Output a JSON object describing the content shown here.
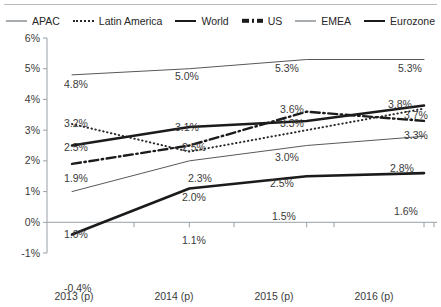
{
  "legend": {
    "items": [
      {
        "label": "APAC",
        "style": "thin"
      },
      {
        "label": "Latin America",
        "style": "dotted"
      },
      {
        "label": "World",
        "style": "thick"
      },
      {
        "label": "US",
        "style": "dashdot"
      },
      {
        "label": "EMEA",
        "style": "thin"
      },
      {
        "label": "Eurozone",
        "style": "thick"
      }
    ]
  },
  "chart_data": {
    "type": "line",
    "title": "",
    "xlabel": "",
    "ylabel": "",
    "categories": [
      "2013 (p)",
      "2014 (p)",
      "2015 (p)",
      "2016 (p)"
    ],
    "ylim": [
      -1,
      6
    ],
    "yticks": [
      "-1%",
      "0%",
      "1%",
      "2%",
      "3%",
      "4%",
      "5%",
      "6%"
    ],
    "ytick_values": [
      -1,
      0,
      1,
      2,
      3,
      4,
      5,
      6
    ],
    "grid": false,
    "legend_position": "top",
    "zero_line": true,
    "series": [
      {
        "name": "APAC",
        "style": "thin",
        "values": [
          4.8,
          5.0,
          5.3,
          5.3
        ],
        "labels": [
          "4.8%",
          "5.0%",
          "5.3%",
          "5.3%"
        ]
      },
      {
        "name": "Latin America",
        "style": "dotted",
        "values": [
          3.2,
          2.3,
          3.0,
          3.7
        ],
        "labels": [
          "3.2%",
          "2.3%",
          "3.0%",
          "3.7%"
        ]
      },
      {
        "name": "World",
        "style": "thick",
        "values": [
          2.5,
          3.1,
          3.3,
          3.8
        ],
        "labels": [
          "2.5%",
          "3.1%",
          "3.3%",
          "3.8%"
        ]
      },
      {
        "name": "US",
        "style": "dashdot",
        "values": [
          1.9,
          2.5,
          3.6,
          3.3
        ],
        "labels": [
          "1.9%",
          "2.5%",
          "3.6%",
          "3.3%"
        ]
      },
      {
        "name": "EMEA",
        "style": "thin",
        "values": [
          1.0,
          2.0,
          2.5,
          2.8
        ],
        "labels": [
          "1.0%",
          "2.0%",
          "2.5%",
          "2.8%"
        ]
      },
      {
        "name": "Eurozone",
        "style": "thick",
        "values": [
          -0.4,
          1.1,
          1.5,
          1.6
        ],
        "labels": [
          "-0.4%",
          "1.1%",
          "1.5%",
          "1.6%"
        ]
      }
    ],
    "colors": {
      "thin": "#55595e",
      "thick": "#1b1b1b",
      "dotted": "#2a2a2a",
      "dashdot": "#1b1b1b",
      "axis": "#9aa0a6",
      "text": "#3a3a3a"
    }
  },
  "data_labels": [
    {
      "text": "4.8%",
      "x": 64,
      "y": 79
    },
    {
      "text": "5.0%",
      "x": 175,
      "y": 71
    },
    {
      "text": "5.3%",
      "x": 275,
      "y": 63
    },
    {
      "text": "5.3%",
      "x": 398,
      "y": 63
    },
    {
      "text": "3.2%",
      "x": 64,
      "y": 118
    },
    {
      "text": "2.3%",
      "x": 188,
      "y": 173
    },
    {
      "text": "3.0%",
      "x": 275,
      "y": 152
    },
    {
      "text": "3.7%",
      "x": 404,
      "y": 110
    },
    {
      "text": "2.5%",
      "x": 64,
      "y": 142
    },
    {
      "text": "3.1%",
      "x": 175,
      "y": 122
    },
    {
      "text": "3.3%",
      "x": 280,
      "y": 118
    },
    {
      "text": "3.8%",
      "x": 388,
      "y": 99
    },
    {
      "text": "1.9%",
      "x": 64,
      "y": 173
    },
    {
      "text": "2.5%",
      "x": 182,
      "y": 142
    },
    {
      "text": "3.6%",
      "x": 280,
      "y": 104
    },
    {
      "text": "3.3%",
      "x": 404,
      "y": 130
    },
    {
      "text": "1.0%",
      "x": 64,
      "y": 229
    },
    {
      "text": "2.0%",
      "x": 182,
      "y": 192
    },
    {
      "text": "2.5%",
      "x": 270,
      "y": 178
    },
    {
      "text": "2.8%",
      "x": 390,
      "y": 163
    },
    {
      "text": "-0.4%",
      "x": 64,
      "y": 283
    },
    {
      "text": "1.1%",
      "x": 182,
      "y": 235
    },
    {
      "text": "1.5%",
      "x": 272,
      "y": 211
    },
    {
      "text": "1.6%",
      "x": 394,
      "y": 206
    }
  ],
  "y_axis_labels": [
    {
      "text": "6%",
      "y": 33
    },
    {
      "text": "5%",
      "y": 63
    },
    {
      "text": "4%",
      "y": 94
    },
    {
      "text": "3%",
      "y": 125
    },
    {
      "text": "2%",
      "y": 155
    },
    {
      "text": "1%",
      "y": 186
    },
    {
      "text": "0%",
      "y": 217
    },
    {
      "text": "-1%",
      "y": 248
    }
  ],
  "x_axis_labels": [
    {
      "text": "2013 (p)",
      "x": 39
    },
    {
      "text": "2014 (p)",
      "x": 139
    },
    {
      "text": "2015 (p)",
      "x": 239
    },
    {
      "text": "2016 (p)",
      "x": 339
    }
  ]
}
